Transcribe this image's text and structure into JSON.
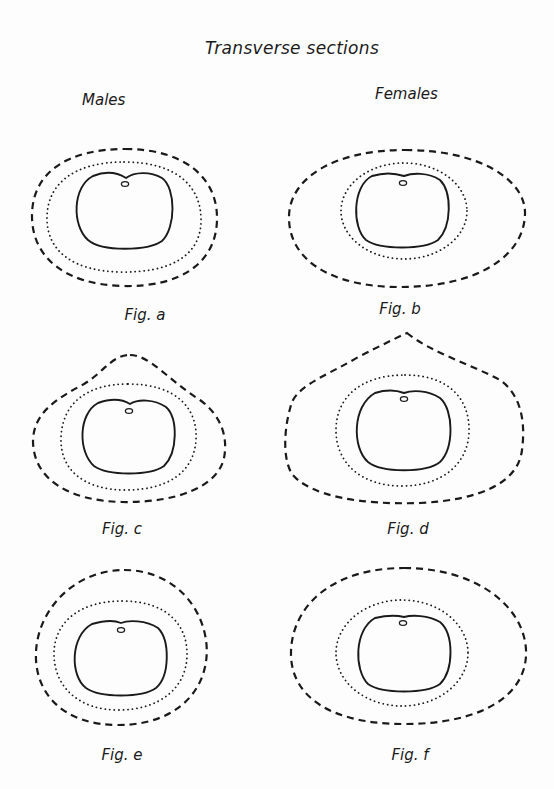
{
  "title": "Transverse sections",
  "columns": {
    "left": "Males",
    "right": "Females"
  },
  "figures": [
    {
      "id": "a",
      "label": "Fig. a",
      "group": "Males",
      "outer_shape": "rounded oval",
      "layers": [
        "dashed outer boundary",
        "dotted middle boundary",
        "solid inner section",
        "small oval mark"
      ]
    },
    {
      "id": "b",
      "label": "Fig. b",
      "group": "Females",
      "outer_shape": "wide ellipse",
      "layers": [
        "dashed outer boundary",
        "dotted middle boundary",
        "solid inner section",
        "small oval mark"
      ]
    },
    {
      "id": "c",
      "label": "Fig. c",
      "group": "Males",
      "outer_shape": "peaked, rounded top",
      "layers": [
        "dashed outer boundary",
        "dotted middle boundary",
        "solid inner section",
        "small oval mark"
      ]
    },
    {
      "id": "d",
      "label": "Fig. d",
      "group": "Females",
      "outer_shape": "peaked, pointed top",
      "layers": [
        "dashed outer boundary",
        "dotted middle boundary",
        "solid inner section",
        "small oval mark"
      ]
    },
    {
      "id": "e",
      "label": "Fig. e",
      "group": "Males",
      "outer_shape": "egg-shaped",
      "layers": [
        "dashed outer boundary",
        "dotted middle boundary",
        "solid inner section",
        "small oval mark"
      ]
    },
    {
      "id": "f",
      "label": "Fig. f",
      "group": "Females",
      "outer_shape": "wide egg-shaped",
      "layers": [
        "dashed outer boundary",
        "dotted middle boundary",
        "solid inner section",
        "small oval mark"
      ]
    }
  ],
  "colors": {
    "ink": "#1a1a1a",
    "paper": "#fdfdfd"
  }
}
